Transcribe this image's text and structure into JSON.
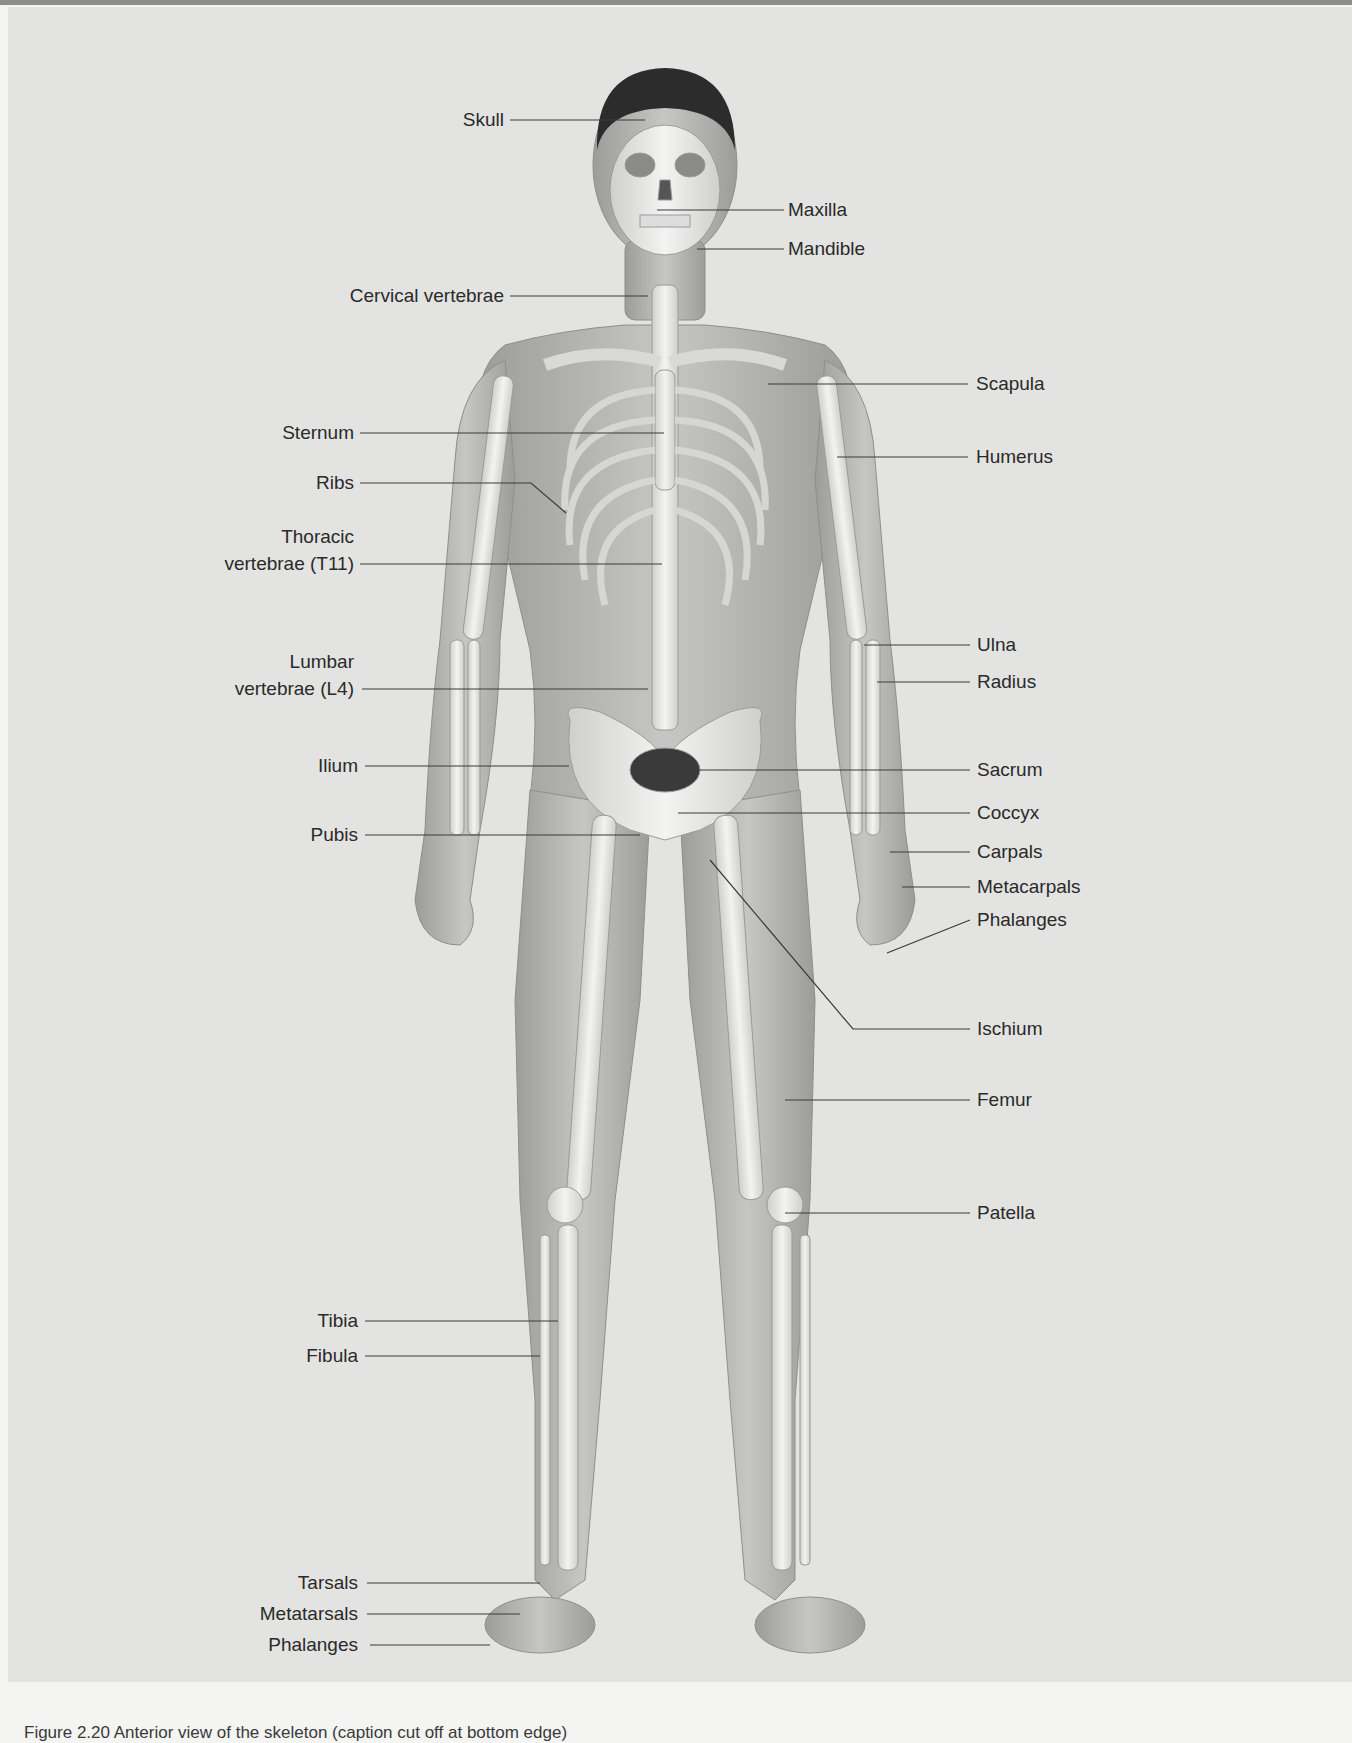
{
  "figure": {
    "type": "anatomical-diagram",
    "caption_partial": "Figure 2.20 Anterior view of the skeleton (caption cut off at bottom edge)",
    "colors": {
      "background": "#e3e3e1",
      "page": "#f4f4f2",
      "skin": "#b7b7b5",
      "bone": "#ededeb",
      "hair": "#2c2c2c",
      "leader_line": "#3a3a3a",
      "label_text": "#2a2a2a"
    }
  },
  "labels": {
    "left": [
      {
        "id": "skull",
        "text": "Skull"
      },
      {
        "id": "cervical",
        "text": "Cervical vertebrae"
      },
      {
        "id": "sternum",
        "text": "Sternum"
      },
      {
        "id": "ribs",
        "text": "Ribs"
      },
      {
        "id": "thoracic_1",
        "text": "Thoracic"
      },
      {
        "id": "thoracic_2",
        "text": "vertebrae (T11)"
      },
      {
        "id": "lumbar_1",
        "text": "Lumbar"
      },
      {
        "id": "lumbar_2",
        "text": "vertebrae (L4)"
      },
      {
        "id": "ilium",
        "text": "Ilium"
      },
      {
        "id": "pubis",
        "text": "Pubis"
      },
      {
        "id": "tibia",
        "text": "Tibia"
      },
      {
        "id": "fibula",
        "text": "Fibula"
      },
      {
        "id": "tarsals",
        "text": "Tarsals"
      },
      {
        "id": "metatarsals",
        "text": "Metatarsals"
      },
      {
        "id": "phalanges_foot",
        "text": "Phalanges"
      }
    ],
    "right": [
      {
        "id": "maxilla",
        "text": "Maxilla"
      },
      {
        "id": "mandible",
        "text": "Mandible"
      },
      {
        "id": "scapula",
        "text": "Scapula"
      },
      {
        "id": "humerus",
        "text": "Humerus"
      },
      {
        "id": "ulna",
        "text": "Ulna"
      },
      {
        "id": "radius",
        "text": "Radius"
      },
      {
        "id": "sacrum",
        "text": "Sacrum"
      },
      {
        "id": "coccyx",
        "text": "Coccyx"
      },
      {
        "id": "carpals",
        "text": "Carpals"
      },
      {
        "id": "metacarpals",
        "text": "Metacarpals"
      },
      {
        "id": "phalanges_hand",
        "text": "Phalanges"
      },
      {
        "id": "ischium",
        "text": "Ischium"
      },
      {
        "id": "femur",
        "text": "Femur"
      },
      {
        "id": "patella",
        "text": "Patella"
      }
    ]
  }
}
